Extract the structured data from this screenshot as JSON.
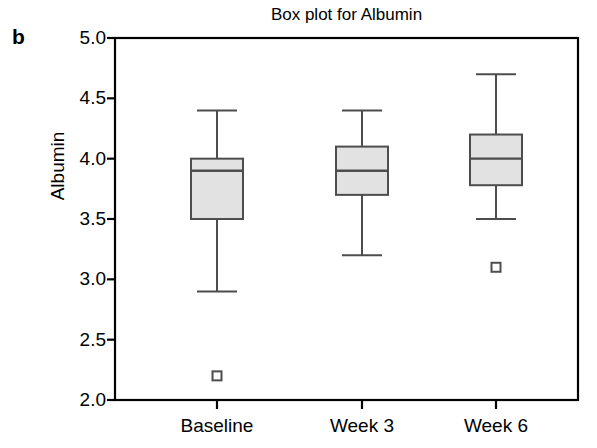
{
  "figure": {
    "panel_label": "b",
    "title": "Box plot for Albumin",
    "background_color": "#ffffff",
    "axis_color": "#000000",
    "box_fill_color": "#e2e2e2",
    "box_stroke_color": "#4d4d4d"
  },
  "chart_data": {
    "type": "box",
    "title": "Box plot for Albumin",
    "xlabel": "",
    "ylabel": "Albumin",
    "categories": [
      "Baseline",
      "Week 3",
      "Week 6"
    ],
    "ylim": [
      2.0,
      5.0
    ],
    "ytick_labels": [
      "5.0",
      "4.5",
      "4.0",
      "3.5",
      "3.0",
      "2.5",
      "2.0"
    ],
    "ytick_values": [
      5.0,
      4.5,
      4.0,
      3.5,
      3.0,
      2.5,
      2.0
    ],
    "grid": false,
    "legend": null,
    "boxes": [
      {
        "category": "Baseline",
        "whisker_low": 2.9,
        "q1": 3.5,
        "median": 3.9,
        "q3": 4.0,
        "whisker_high": 4.4,
        "outliers": [
          2.2
        ]
      },
      {
        "category": "Week 3",
        "whisker_low": 3.2,
        "q1": 3.7,
        "median": 3.9,
        "q3": 4.1,
        "whisker_high": 4.4,
        "outliers": []
      },
      {
        "category": "Week 6",
        "whisker_low": 3.5,
        "q1": 3.78,
        "median": 4.0,
        "q3": 4.2,
        "whisker_high": 4.7,
        "outliers": [
          3.1
        ]
      }
    ]
  },
  "plot_geometry": {
    "left": 115,
    "right": 578,
    "top": 38,
    "bottom": 400,
    "value_top": 5.0,
    "value_bottom": 2.0,
    "box_half_width": 26,
    "cap_half_width": 20,
    "outlier_size": 9,
    "category_centers": [
      217,
      362,
      496
    ]
  }
}
